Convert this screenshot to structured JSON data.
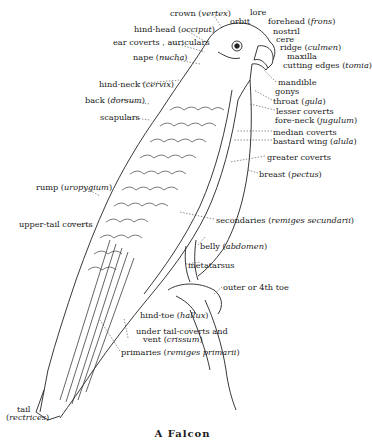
{
  "figure": {
    "caption": "A Falcon",
    "labels": [
      {
        "id": "crown",
        "text": "crown",
        "latin": "vertex",
        "x": 170,
        "y": 9
      },
      {
        "id": "orbit",
        "text": "orbit",
        "latin": "",
        "x": 230,
        "y": 17
      },
      {
        "id": "lore",
        "text": "lore",
        "latin": "",
        "x": 250,
        "y": 8
      },
      {
        "id": "forehead",
        "text": "forehead",
        "latin": "frons",
        "x": 268,
        "y": 17
      },
      {
        "id": "nostril",
        "text": "nostril",
        "latin": "",
        "x": 273,
        "y": 27
      },
      {
        "id": "cere",
        "text": "cere",
        "latin": "",
        "x": 276,
        "y": 35
      },
      {
        "id": "ridge",
        "text": "ridge",
        "latin": "culmen",
        "x": 280,
        "y": 43
      },
      {
        "id": "maxilla",
        "text": "maxilla",
        "latin": "",
        "x": 287,
        "y": 52
      },
      {
        "id": "cutting-edges",
        "text": "cutting edges",
        "latin": "tomia",
        "x": 283,
        "y": 61
      },
      {
        "id": "hind-head",
        "text": "hind-head",
        "latin": "occiput",
        "x": 134,
        "y": 25
      },
      {
        "id": "ear-coverts",
        "text": "ear coverts , auriculars",
        "latin": "",
        "x": 113,
        "y": 38
      },
      {
        "id": "nape",
        "text": "nape",
        "latin": "nucha",
        "x": 133,
        "y": 53
      },
      {
        "id": "hind-neck",
        "text": "hind-neck",
        "latin": "cervix",
        "x": 99,
        "y": 80
      },
      {
        "id": "back",
        "text": "back",
        "latin": "dorsum",
        "x": 85,
        "y": 96
      },
      {
        "id": "scapulars",
        "text": "scapulars",
        "latin": "",
        "x": 100,
        "y": 113
      },
      {
        "id": "mandible",
        "text": "mandible",
        "latin": "",
        "x": 278,
        "y": 78
      },
      {
        "id": "gonys",
        "text": "gonys",
        "latin": "",
        "x": 275,
        "y": 87
      },
      {
        "id": "throat",
        "text": "throat",
        "latin": "gula",
        "x": 273,
        "y": 97
      },
      {
        "id": "lesser-coverts",
        "text": "lesser coverts",
        "latin": "",
        "x": 276,
        "y": 107
      },
      {
        "id": "fore-neck",
        "text": "fore-neck",
        "latin": "jugulum",
        "x": 275,
        "y": 116
      },
      {
        "id": "median-coverts",
        "text": "median coverts",
        "latin": "",
        "x": 273,
        "y": 128
      },
      {
        "id": "bastard-wing",
        "text": "bastard wing",
        "latin": "alula",
        "x": 273,
        "y": 137
      },
      {
        "id": "greater-coverts",
        "text": "greater coverts",
        "latin": "",
        "x": 267,
        "y": 153
      },
      {
        "id": "breast",
        "text": "breast",
        "latin": "pectus",
        "x": 259,
        "y": 170
      },
      {
        "id": "rump",
        "text": "rump",
        "latin": "uropygium",
        "x": 36,
        "y": 183
      },
      {
        "id": "upper-tail-coverts",
        "text": "upper-tail coverts",
        "latin": "",
        "x": 19,
        "y": 220
      },
      {
        "id": "secondaries",
        "text": "secondaries",
        "latin": "remiges secundarii",
        "x": 216,
        "y": 216
      },
      {
        "id": "belly",
        "text": "belly",
        "latin": "abdomen",
        "x": 200,
        "y": 242
      },
      {
        "id": "metatarsus",
        "text": "metatarsus",
        "latin": "",
        "x": 188,
        "y": 261
      },
      {
        "id": "outer-toe",
        "text": "outer or 4th toe",
        "latin": "",
        "x": 223,
        "y": 283
      },
      {
        "id": "hind-toe",
        "text": "hind-toe",
        "latin": "hallux",
        "x": 140,
        "y": 311
      },
      {
        "id": "under-tail-coverts",
        "text": "under tail-coverts and",
        "latin": "",
        "x": 136,
        "y": 327
      },
      {
        "id": "vent",
        "text": "vent",
        "latin": "crissum",
        "x": 143,
        "y": 335
      },
      {
        "id": "primaries",
        "text": "primaries",
        "latin": "remiges primarii",
        "x": 121,
        "y": 348
      },
      {
        "id": "tail",
        "text": "tail",
        "latin": "",
        "x": 17,
        "y": 405
      },
      {
        "id": "rectrices",
        "text": "",
        "latin": "rectrices",
        "x": 6,
        "y": 413
      }
    ]
  }
}
